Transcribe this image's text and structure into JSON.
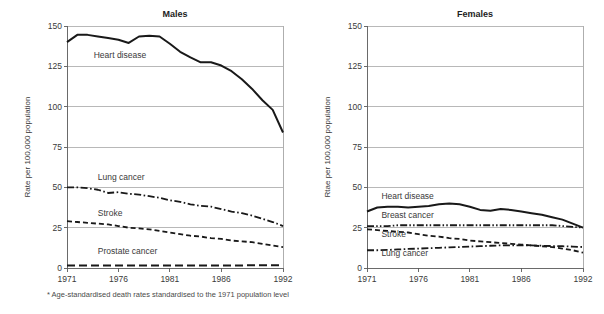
{
  "figure": {
    "footnote": "* Age-standardised death rates standardised to the 1971 population level",
    "footnote_marker": "*",
    "background_color": "#ffffff",
    "line_color": "#191919",
    "grid_color": "#9a9a9a"
  },
  "panels": {
    "left": {
      "title": "Males",
      "ylabel": "Rate per 100,000 population",
      "ytick_labels": [
        "0",
        "25",
        "50",
        "75",
        "100",
        "125",
        "150"
      ],
      "xtick_labels": [
        "1971",
        "1976",
        "1981",
        "1986",
        "1992"
      ],
      "series_labels": [
        "Heart disease",
        "Lung cancer",
        "Stroke",
        "Prostate cancer"
      ]
    },
    "right": {
      "title": "Females",
      "ylabel": "Rtae per 100,000 population",
      "ytick_labels": [
        "0",
        "25",
        "50",
        "75",
        "100",
        "125",
        "150"
      ],
      "xtick_labels": [
        "1971",
        "1976",
        "1981",
        "1986",
        "1992"
      ],
      "series_labels": [
        "Heart disease",
        "Breast cancer",
        "Stroke",
        "Lung cancer"
      ]
    }
  },
  "chart_data": [
    {
      "type": "line",
      "title": "Males",
      "xlabel": "",
      "ylabel": "Rate per 100,000 population",
      "xlim": [
        1971,
        1992
      ],
      "ylim": [
        0,
        150
      ],
      "yticks": [
        0,
        25,
        50,
        75,
        100,
        125,
        150
      ],
      "xticks": [
        1971,
        1976,
        1981,
        1986,
        1992
      ],
      "grid": true,
      "legend": "inline-labels",
      "x": [
        1971,
        1972,
        1973,
        1974,
        1975,
        1976,
        1977,
        1978,
        1979,
        1980,
        1981,
        1982,
        1983,
        1984,
        1985,
        1986,
        1987,
        1988,
        1989,
        1990,
        1991,
        1992
      ],
      "series": [
        {
          "name": "Heart disease",
          "dash": "solid",
          "width": 2.0,
          "values": [
            140,
            144.5,
            144.5,
            143.5,
            142.5,
            141.5,
            139.5,
            143.5,
            144,
            143.5,
            139,
            134,
            130.5,
            127.5,
            127.5,
            125.5,
            122,
            117,
            111,
            104,
            98,
            84
          ]
        },
        {
          "name": "Lung cancer",
          "dash": "dash-dot",
          "width": 1.8,
          "values": [
            50,
            50,
            49.5,
            48.5,
            46.5,
            47,
            46,
            45.5,
            44.5,
            43.5,
            42,
            41,
            39.5,
            38.5,
            38,
            36.5,
            35,
            34,
            32.5,
            30.5,
            28.5,
            26
          ]
        },
        {
          "name": "Stroke",
          "dash": "dashed",
          "width": 1.8,
          "values": [
            29,
            28.5,
            28,
            27.5,
            27,
            26,
            25,
            24.5,
            24,
            23,
            22,
            21,
            20,
            19.5,
            18.5,
            18,
            17,
            16.5,
            16,
            15,
            14,
            13
          ]
        },
        {
          "name": "Prostate cancer",
          "dash": "long-dash",
          "width": 2.0,
          "values": [
            1.5,
            1.5,
            1.5,
            1.5,
            1.5,
            1.5,
            1.5,
            1.5,
            1.5,
            1.5,
            1.5,
            1.5,
            1.6,
            1.6,
            1.6,
            1.6,
            1.6,
            1.6,
            1.7,
            1.7,
            1.7,
            1.7
          ]
        }
      ],
      "series_label_positions": [
        {
          "name": "Heart disease",
          "x": 1973.6,
          "y": 130
        },
        {
          "name": "Lung cancer",
          "x": 1974.0,
          "y": 54.5
        },
        {
          "name": "Stroke",
          "x": 1974.0,
          "y": 32.5
        },
        {
          "name": "Prostate cancer",
          "x": 1974.0,
          "y": 8.5
        }
      ]
    },
    {
      "type": "line",
      "title": "Females",
      "xlabel": "",
      "ylabel": "Rtae per 100,000 population",
      "xlim": [
        1971,
        1992
      ],
      "ylim": [
        0,
        150
      ],
      "yticks": [
        0,
        25,
        50,
        75,
        100,
        125,
        150
      ],
      "xticks": [
        1971,
        1976,
        1981,
        1986,
        1992
      ],
      "grid": true,
      "legend": "inline-labels",
      "x": [
        1971,
        1972,
        1973,
        1974,
        1975,
        1976,
        1977,
        1978,
        1979,
        1980,
        1981,
        1982,
        1983,
        1984,
        1985,
        1986,
        1987,
        1988,
        1989,
        1990,
        1991,
        1992
      ],
      "series": [
        {
          "name": "Heart disease",
          "dash": "solid",
          "width": 2.0,
          "values": [
            35,
            37.5,
            38,
            38,
            37.5,
            38,
            38.5,
            39.5,
            40,
            39.5,
            38,
            36,
            35.5,
            36.5,
            36,
            35,
            34,
            33,
            31.5,
            30,
            27.5,
            25
          ]
        },
        {
          "name": "Breast cancer",
          "dash": "dash-dot-dot",
          "width": 1.8,
          "values": [
            26,
            26,
            26,
            26.5,
            26.5,
            26.5,
            26.5,
            26.5,
            26.5,
            26.5,
            26.5,
            26.5,
            26.5,
            26.5,
            26.5,
            26.5,
            26.5,
            26.5,
            26.5,
            26,
            25.5,
            25
          ]
        },
        {
          "name": "Stroke",
          "dash": "dashed",
          "width": 1.8,
          "values": [
            24,
            23.5,
            23,
            22.5,
            22,
            21,
            20,
            19.5,
            18.5,
            18,
            17,
            16.5,
            16,
            15.5,
            15,
            14.5,
            14,
            13.5,
            13,
            12,
            11,
            9.5
          ]
        },
        {
          "name": "Lung cancer",
          "dash": "dash-dot",
          "width": 1.8,
          "values": [
            11,
            11,
            11.2,
            11.5,
            11.8,
            12,
            12.3,
            12.5,
            12.8,
            13,
            13.3,
            13.5,
            13.8,
            14,
            14,
            14,
            14,
            13.8,
            13.6,
            13.5,
            13.3,
            13
          ]
        }
      ],
      "series_label_positions": [
        {
          "name": "Heart disease",
          "x": 1972.4,
          "y": 43
        },
        {
          "name": "Breast cancer",
          "x": 1972.4,
          "y": 31
        },
        {
          "name": "Stroke",
          "x": 1972.4,
          "y": 19.5
        },
        {
          "name": "Lung cancer",
          "x": 1972.4,
          "y": 7.5
        }
      ]
    }
  ]
}
